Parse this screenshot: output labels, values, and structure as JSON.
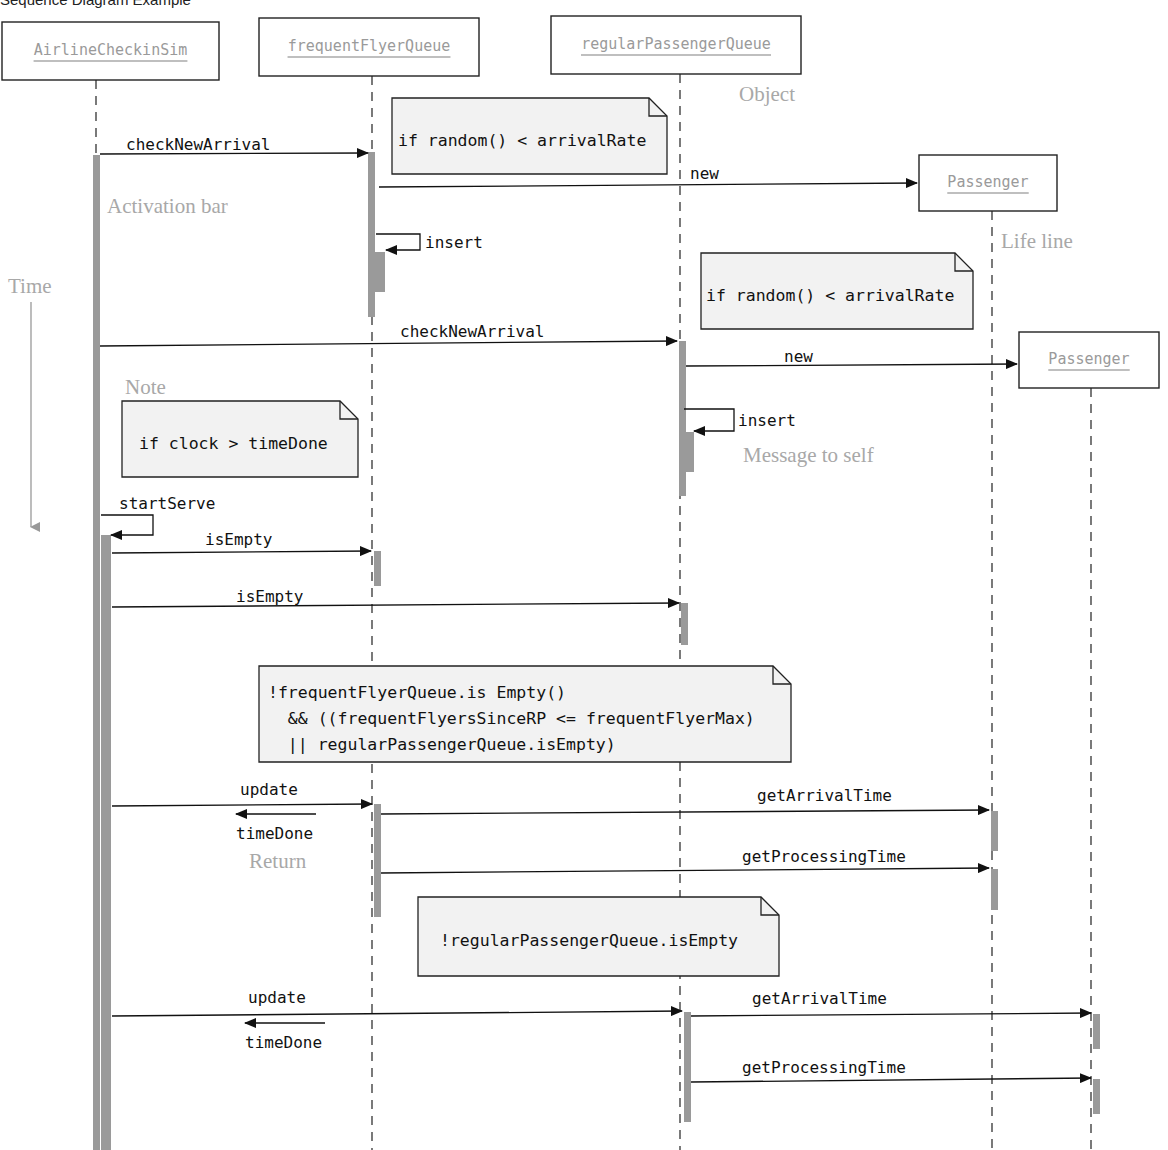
{
  "title": "Sequence Diagram Example",
  "colors": {
    "activation": "#9a9a9a",
    "line": "#222222",
    "note_fill": "#f2f2f2",
    "object_text": "#9a9a9a",
    "annotation_text": "#a8a8a8"
  },
  "objects": [
    {
      "id": "sim",
      "label": "AirlineCheckinSim",
      "x": 2,
      "y": 22,
      "w": 217,
      "h": 58,
      "lifeline_x": 96,
      "lifeline_end": 1150
    },
    {
      "id": "ffq",
      "label": "frequentFlyerQueue",
      "x": 259,
      "y": 18,
      "w": 220,
      "h": 58,
      "lifeline_x": 372,
      "lifeline_end": 1150
    },
    {
      "id": "rpq",
      "label": "regularPassengerQueue",
      "x": 551,
      "y": 16,
      "w": 250,
      "h": 58,
      "lifeline_x": 680,
      "lifeline_end": 1150
    },
    {
      "id": "p1",
      "label": "Passenger",
      "x": 919,
      "y": 155,
      "w": 138,
      "h": 56,
      "lifeline_x": 992,
      "lifeline_end": 1150
    },
    {
      "id": "p2",
      "label": "Passenger",
      "x": 1019,
      "y": 332,
      "w": 140,
      "h": 56,
      "lifeline_x": 1091,
      "lifeline_end": 1150
    }
  ],
  "activations": [
    {
      "x": 93,
      "y": 155,
      "w": 7,
      "h": 995
    },
    {
      "x": 101,
      "y": 535,
      "w": 10,
      "h": 615
    },
    {
      "x": 368,
      "y": 152,
      "w": 7,
      "h": 165
    },
    {
      "x": 375,
      "y": 252,
      "w": 10,
      "h": 40
    },
    {
      "x": 679,
      "y": 341,
      "w": 7,
      "h": 155
    },
    {
      "x": 686,
      "y": 432,
      "w": 8,
      "h": 40
    },
    {
      "x": 374,
      "y": 551,
      "w": 7,
      "h": 35
    },
    {
      "x": 681,
      "y": 603,
      "w": 7,
      "h": 42
    },
    {
      "x": 374,
      "y": 804,
      "w": 7,
      "h": 113
    },
    {
      "x": 991,
      "y": 811,
      "w": 7,
      "h": 40
    },
    {
      "x": 991,
      "y": 869,
      "w": 7,
      "h": 41
    },
    {
      "x": 684,
      "y": 1012,
      "w": 7,
      "h": 110
    },
    {
      "x": 1093,
      "y": 1014,
      "w": 7,
      "h": 35
    },
    {
      "x": 1093,
      "y": 1079,
      "w": 7,
      "h": 35
    }
  ],
  "messages": [
    {
      "label": "checkNewArrival",
      "x1": 100,
      "y1": 154,
      "x2": 368,
      "y2": 153,
      "lx": 126,
      "ly": 150,
      "type": "call"
    },
    {
      "label": "new",
      "x1": 379,
      "y1": 187,
      "x2": 917,
      "y2": 183,
      "lx": 690,
      "ly": 179,
      "type": "call"
    },
    {
      "label": "checkNewArrival",
      "x1": 100,
      "y1": 346,
      "x2": 677,
      "y2": 341,
      "lx": 400,
      "ly": 337,
      "type": "call"
    },
    {
      "label": "new",
      "x1": 686,
      "y1": 366,
      "x2": 1017,
      "y2": 364,
      "lx": 784,
      "ly": 362,
      "type": "call"
    },
    {
      "label": "isEmpty",
      "x1": 112,
      "y1": 553,
      "x2": 371,
      "y2": 551,
      "lx": 205,
      "ly": 545,
      "type": "call"
    },
    {
      "label": "isEmpty",
      "x1": 112,
      "y1": 607,
      "x2": 679,
      "y2": 603,
      "lx": 236,
      "ly": 602,
      "type": "call"
    },
    {
      "label": "update",
      "x1": 112,
      "y1": 806,
      "x2": 372,
      "y2": 804,
      "lx": 240,
      "ly": 795,
      "type": "call"
    },
    {
      "label": "getArrivalTime",
      "x1": 381,
      "y1": 814,
      "x2": 989,
      "y2": 810,
      "lx": 757,
      "ly": 801,
      "type": "call"
    },
    {
      "label": "getProcessingTime",
      "x1": 381,
      "y1": 873,
      "x2": 989,
      "y2": 868,
      "lx": 742,
      "ly": 862,
      "type": "call"
    },
    {
      "label": "update",
      "x1": 112,
      "y1": 1016,
      "x2": 682,
      "y2": 1011,
      "lx": 248,
      "ly": 1003,
      "type": "call"
    },
    {
      "label": "getArrivalTime",
      "x1": 691,
      "y1": 1016,
      "x2": 1091,
      "y2": 1013,
      "lx": 752,
      "ly": 1004,
      "type": "call"
    },
    {
      "label": "getProcessingTime",
      "x1": 691,
      "y1": 1082,
      "x2": 1091,
      "y2": 1078,
      "lx": 742,
      "ly": 1073,
      "type": "call"
    }
  ],
  "returns": [
    {
      "label": "timeDone",
      "x1": 316,
      "y1": 814,
      "x2": 236,
      "y2": 814,
      "lx": 236,
      "ly": 839
    },
    {
      "label": "timeDone",
      "x1": 325,
      "y1": 1023,
      "x2": 245,
      "y2": 1023,
      "lx": 245,
      "ly": 1048
    }
  ],
  "self_messages": [
    {
      "label": "insert",
      "x": 376,
      "y_top": 234,
      "y_bottom": 250,
      "right": 420,
      "lx": 425,
      "ly": 248
    },
    {
      "label": "insert",
      "x": 684,
      "y_top": 409,
      "y_bottom": 431,
      "right": 734,
      "lx": 738,
      "ly": 426
    },
    {
      "label": "startServe",
      "x": 101,
      "y_top": 515,
      "y_bottom": 535,
      "right": 153,
      "lx": 119,
      "ly": 509
    }
  ],
  "notes": [
    {
      "lines": [
        "if random() < arrivalRate"
      ],
      "x": 392,
      "y": 98,
      "w": 275,
      "h": 76,
      "tx": 398,
      "ty": 146
    },
    {
      "lines": [
        "if random() < arrivalRate"
      ],
      "x": 701,
      "y": 253,
      "w": 272,
      "h": 76,
      "tx": 706,
      "ty": 301
    },
    {
      "lines": [
        "if clock > timeDone"
      ],
      "x": 122,
      "y": 401,
      "w": 236,
      "h": 76,
      "tx": 139,
      "ty": 449
    },
    {
      "lines": [
        "!frequentFlyerQueue.is Empty()",
        "  && ((frequentFlyersSinceRP <= frequentFlyerMax)",
        "  || regularPassengerQueue.isEmpty)"
      ],
      "x": 259,
      "y": 666,
      "w": 532,
      "h": 96,
      "tx": 268,
      "ty": 698
    },
    {
      "lines": [
        "!regularPassengerQueue.isEmpty"
      ],
      "x": 418,
      "y": 897,
      "w": 361,
      "h": 79,
      "tx": 440,
      "ty": 946
    }
  ],
  "annotations": [
    {
      "label": "Object",
      "x": 739,
      "y": 101
    },
    {
      "label": "Activation bar",
      "x": 107,
      "y": 213
    },
    {
      "label": "Life line",
      "x": 1001,
      "y": 248
    },
    {
      "label": "Time",
      "x": 8,
      "y": 293
    },
    {
      "label": "Note",
      "x": 125,
      "y": 394
    },
    {
      "label": "Message to self",
      "x": 743,
      "y": 462
    },
    {
      "label": "Return",
      "x": 249,
      "y": 868
    }
  ],
  "time_axis": {
    "x": 31,
    "y1": 302,
    "y2": 527
  }
}
